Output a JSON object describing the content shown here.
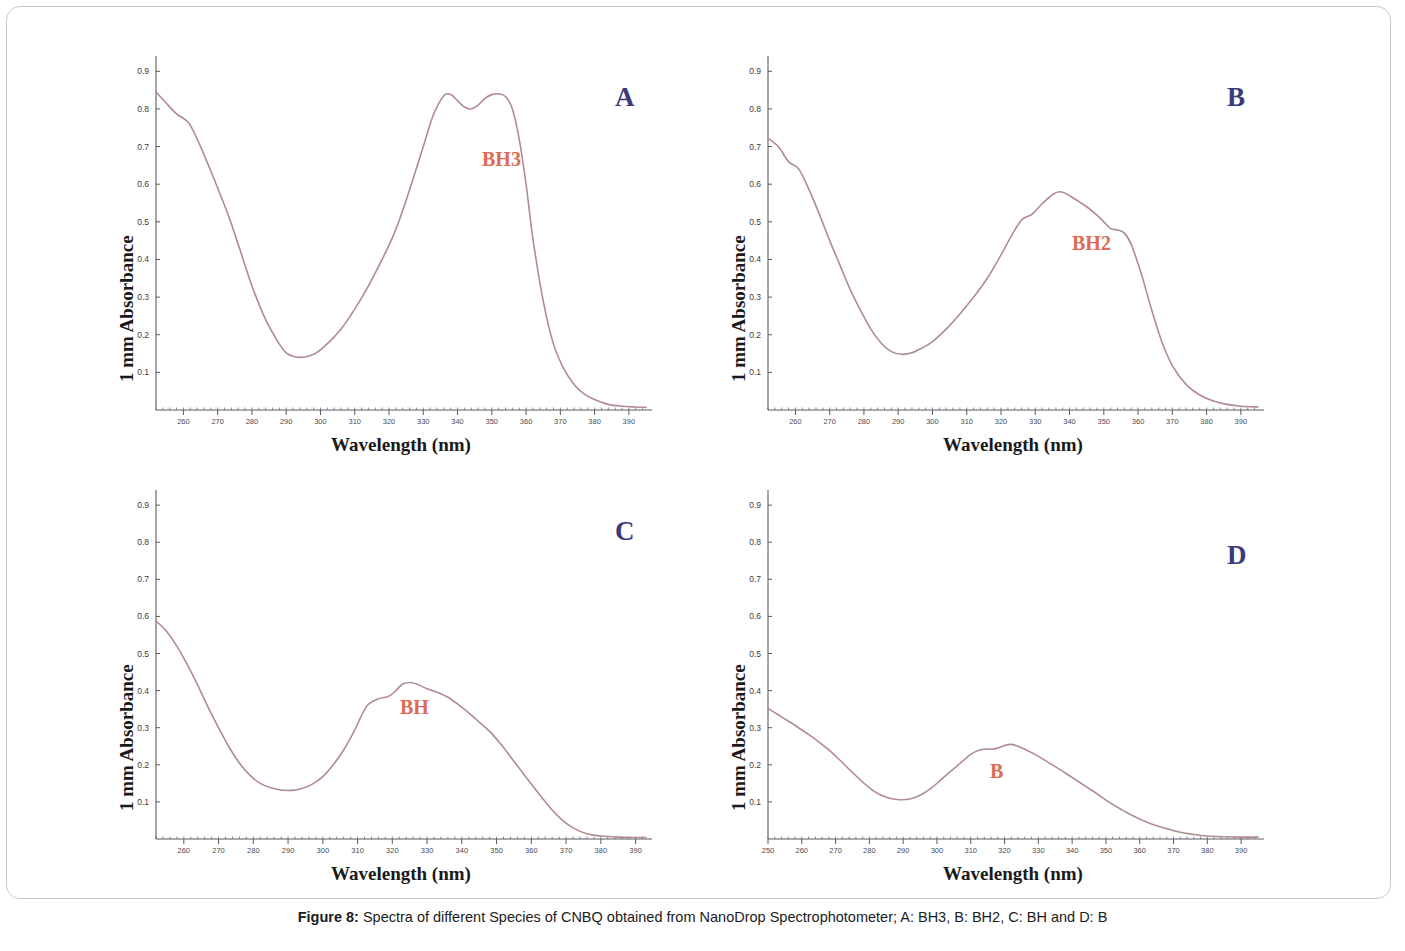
{
  "figure": {
    "caption_label": "Figure 8:",
    "caption_text": " Spectra of different Species of CNBQ obtained from NanoDrop Spectrophotometer; A: BH3, B: BH2, C: BH and D: B",
    "curve_color": "#b08b8f",
    "label_color": "#e06a52",
    "panel_letter_color": "#3b3b7a",
    "axis_color": "#5a5a66"
  },
  "panels": [
    {
      "letter": "A",
      "curve_label": "BH3",
      "xlabel": "Wavelength (nm)",
      "ylabel": "1 mm Absorbance"
    },
    {
      "letter": "B",
      "curve_label": "BH2",
      "xlabel": "Wavelength (nm)",
      "ylabel": "1 mm Absorbance"
    },
    {
      "letter": "C",
      "curve_label": "BH",
      "xlabel": "Wavelength (nm)",
      "ylabel": "1 mm Absorbance"
    },
    {
      "letter": "D",
      "curve_label": "B",
      "xlabel": "Wavelength (nm)",
      "ylabel": "1 mm Absorbance"
    }
  ],
  "chart_data": [
    {
      "type": "line",
      "panel": "A",
      "series_name": "BH3",
      "title": "",
      "xlabel": "Wavelength (nm)",
      "ylabel": "1 mm Absorbance",
      "xlim": [
        252,
        395
      ],
      "ylim": [
        0,
        0.93
      ],
      "xticks": [
        260,
        270,
        280,
        290,
        300,
        310,
        320,
        330,
        340,
        350,
        360,
        370,
        380,
        390
      ],
      "yticks": [
        0.1,
        0.2,
        0.3,
        0.4,
        0.5,
        0.6,
        0.7,
        0.8,
        0.9
      ],
      "ytick_labels": [
        "0.1",
        "0.2",
        "0.3",
        "0.4",
        "0.5",
        "0.6",
        "0.7",
        "0.8",
        "0.9"
      ],
      "grid": false,
      "legend": "none",
      "x": [
        252,
        255,
        258,
        260,
        262,
        265,
        268,
        270,
        273,
        276,
        280,
        284,
        288,
        290,
        292,
        295,
        298,
        300,
        303,
        306,
        310,
        314,
        318,
        322,
        326,
        330,
        333,
        336,
        338,
        340,
        342,
        344,
        346,
        348,
        350,
        352,
        354,
        356,
        358,
        360,
        362,
        365,
        368,
        371,
        374,
        377,
        380,
        384,
        388,
        392,
        395
      ],
      "y": [
        0.845,
        0.815,
        0.787,
        0.775,
        0.757,
        0.7,
        0.635,
        0.59,
        0.52,
        0.44,
        0.33,
        0.24,
        0.175,
        0.152,
        0.143,
        0.14,
        0.148,
        0.16,
        0.185,
        0.215,
        0.268,
        0.33,
        0.4,
        0.48,
        0.585,
        0.7,
        0.785,
        0.835,
        0.838,
        0.822,
        0.805,
        0.8,
        0.81,
        0.828,
        0.838,
        0.84,
        0.833,
        0.8,
        0.72,
        0.6,
        0.455,
        0.29,
        0.175,
        0.11,
        0.068,
        0.042,
        0.028,
        0.015,
        0.01,
        0.008,
        0.007
      ]
    },
    {
      "type": "line",
      "panel": "B",
      "series_name": "BH2",
      "title": "",
      "xlabel": "Wavelength (nm)",
      "ylabel": "1 mm Absorbance",
      "xlim": [
        252,
        395
      ],
      "ylim": [
        0,
        0.93
      ],
      "xticks": [
        260,
        270,
        280,
        290,
        300,
        310,
        320,
        330,
        340,
        350,
        360,
        370,
        380,
        390
      ],
      "yticks": [
        0.1,
        0.2,
        0.3,
        0.4,
        0.5,
        0.6,
        0.7,
        0.8,
        0.9
      ],
      "ytick_labels": [
        "0.1",
        "0.2",
        "0.3",
        "0.4",
        "0.5",
        "0.6",
        "0.7",
        "0.8",
        "0.9"
      ],
      "grid": false,
      "legend": "none",
      "x": [
        252,
        255,
        258,
        261,
        264,
        267,
        270,
        273,
        276,
        279,
        282,
        285,
        288,
        291,
        294,
        297,
        300,
        304,
        308,
        312,
        316,
        320,
        323,
        326,
        329,
        332,
        335,
        337,
        339,
        342,
        345,
        348,
        350,
        352,
        354,
        356,
        358,
        361,
        364,
        367,
        370,
        374,
        378,
        382,
        386,
        390,
        395
      ],
      "y": [
        0.722,
        0.7,
        0.66,
        0.64,
        0.585,
        0.52,
        0.45,
        0.385,
        0.32,
        0.265,
        0.215,
        0.178,
        0.155,
        0.148,
        0.152,
        0.165,
        0.182,
        0.215,
        0.255,
        0.3,
        0.35,
        0.412,
        0.462,
        0.505,
        0.52,
        0.548,
        0.572,
        0.58,
        0.575,
        0.558,
        0.54,
        0.518,
        0.5,
        0.482,
        0.478,
        0.47,
        0.44,
        0.36,
        0.265,
        0.18,
        0.118,
        0.068,
        0.04,
        0.024,
        0.015,
        0.01,
        0.008
      ]
    },
    {
      "type": "line",
      "panel": "C",
      "series_name": "BH",
      "title": "",
      "xlabel": "Wavelength (nm)",
      "ylabel": "1 mm Absorbance",
      "xlim": [
        252,
        393
      ],
      "ylim": [
        0,
        0.93
      ],
      "xticks": [
        260,
        270,
        280,
        290,
        300,
        310,
        320,
        330,
        340,
        350,
        360,
        370,
        380,
        390
      ],
      "yticks": [
        0.1,
        0.2,
        0.3,
        0.4,
        0.5,
        0.6,
        0.7,
        0.8,
        0.9
      ],
      "ytick_labels": [
        "0.1",
        "0.2",
        "0.3",
        "0.4",
        "0.5",
        "0.6",
        "0.7",
        "0.8",
        "0.9"
      ],
      "grid": false,
      "legend": "none",
      "x": [
        252,
        255,
        258,
        261,
        264,
        267,
        270,
        273,
        276,
        279,
        282,
        285,
        288,
        291,
        294,
        297,
        300,
        303,
        306,
        309,
        311,
        313,
        316,
        319,
        321,
        323,
        325,
        327,
        330,
        333,
        336,
        339,
        342,
        345,
        348,
        351,
        354,
        357,
        360,
        363,
        366,
        369,
        372,
        376,
        380,
        385,
        390,
        393
      ],
      "y": [
        0.588,
        0.56,
        0.52,
        0.47,
        0.415,
        0.355,
        0.3,
        0.248,
        0.205,
        0.172,
        0.15,
        0.138,
        0.132,
        0.131,
        0.136,
        0.148,
        0.168,
        0.2,
        0.24,
        0.29,
        0.33,
        0.362,
        0.378,
        0.385,
        0.4,
        0.418,
        0.422,
        0.418,
        0.405,
        0.395,
        0.382,
        0.362,
        0.34,
        0.315,
        0.29,
        0.258,
        0.222,
        0.185,
        0.148,
        0.112,
        0.078,
        0.05,
        0.03,
        0.014,
        0.008,
        0.005,
        0.004,
        0.004
      ]
    },
    {
      "type": "line",
      "panel": "D",
      "series_name": "B",
      "title": "",
      "xlabel": "Wavelength (nm)",
      "ylabel": "1 mm Absorbance",
      "xlim": [
        250,
        395
      ],
      "ylim": [
        0,
        0.93
      ],
      "xticks": [
        250,
        260,
        270,
        280,
        290,
        300,
        310,
        320,
        330,
        340,
        350,
        360,
        370,
        380,
        390
      ],
      "yticks": [
        0.1,
        0.2,
        0.3,
        0.4,
        0.5,
        0.6,
        0.7,
        0.8,
        0.9
      ],
      "ytick_labels": [
        "0.1",
        "0.2",
        "0.3",
        "0.4",
        "0.5",
        "0.6",
        "0.7",
        "0.8",
        "0.9"
      ],
      "grid": false,
      "legend": "none",
      "x": [
        250,
        253,
        256,
        259,
        262,
        265,
        268,
        271,
        274,
        277,
        280,
        283,
        286,
        289,
        292,
        295,
        298,
        301,
        304,
        307,
        310,
        312,
        314,
        316,
        318,
        320,
        322,
        324,
        326,
        329,
        332,
        335,
        338,
        341,
        344,
        347,
        350,
        353,
        356,
        359,
        362,
        365,
        368,
        372,
        376,
        380,
        385,
        390,
        395
      ],
      "y": [
        0.352,
        0.335,
        0.318,
        0.3,
        0.282,
        0.262,
        0.24,
        0.215,
        0.188,
        0.162,
        0.138,
        0.12,
        0.11,
        0.106,
        0.108,
        0.118,
        0.135,
        0.158,
        0.182,
        0.205,
        0.228,
        0.238,
        0.242,
        0.242,
        0.245,
        0.252,
        0.255,
        0.25,
        0.242,
        0.228,
        0.212,
        0.195,
        0.178,
        0.16,
        0.142,
        0.124,
        0.105,
        0.088,
        0.072,
        0.058,
        0.046,
        0.036,
        0.028,
        0.018,
        0.012,
        0.008,
        0.006,
        0.005,
        0.005
      ]
    }
  ]
}
